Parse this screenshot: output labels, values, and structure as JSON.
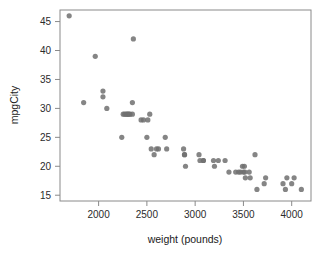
{
  "chart_data": {
    "type": "scatter",
    "title": "",
    "xlabel": "weight (pounds)",
    "ylabel": "mpgCity",
    "xlim": [
      1600,
      4200
    ],
    "ylim": [
      14,
      47
    ],
    "xticks": [
      2000,
      2500,
      3000,
      3500,
      4000
    ],
    "yticks": [
      15,
      20,
      25,
      30,
      35,
      40,
      45
    ],
    "xtick_labels": [
      "2000",
      "2500",
      "3000",
      "3500",
      "4000"
    ],
    "ytick_labels": [
      "15",
      "20",
      "25",
      "30",
      "35",
      "40",
      "45"
    ],
    "grid": false,
    "legend": false,
    "marker": {
      "shape": "circle",
      "color": "#707070",
      "radius": 2.6,
      "opacity": 0.85
    },
    "axis_color": "#8a8a8a",
    "background": "#ffffff",
    "n_points": 57,
    "x": [
      1695,
      1845,
      1965,
      2045,
      2045,
      2085,
      2240,
      2255,
      2270,
      2285,
      2295,
      2305,
      2315,
      2325,
      2350,
      2350,
      2360,
      2440,
      2465,
      2500,
      2510,
      2530,
      2545,
      2575,
      2600,
      2620,
      2690,
      2705,
      2880,
      2890,
      2890,
      2900,
      3040,
      3050,
      3085,
      3085,
      3190,
      3200,
      3240,
      3310,
      3350,
      3420,
      3450,
      3470,
      3490,
      3500,
      3510,
      3515,
      3520,
      3560,
      3570,
      3620,
      3640,
      3715,
      3730,
      3910,
      3935,
      3950,
      4000,
      4025,
      4100
    ],
    "y": [
      46,
      31,
      39,
      33,
      32,
      30,
      25,
      29,
      29,
      29,
      29,
      29,
      29,
      29,
      31,
      29,
      42,
      28,
      28,
      25,
      28,
      29,
      23,
      22,
      23,
      23,
      25,
      23,
      23,
      22,
      22,
      20,
      22,
      21,
      21,
      21,
      21,
      20,
      21,
      21,
      19,
      19,
      19,
      19,
      20,
      19,
      20,
      19,
      18,
      19,
      18,
      22,
      16,
      17,
      18,
      17,
      16,
      18,
      17,
      18,
      16
    ]
  },
  "figure": {
    "width": 322,
    "height": 256
  }
}
